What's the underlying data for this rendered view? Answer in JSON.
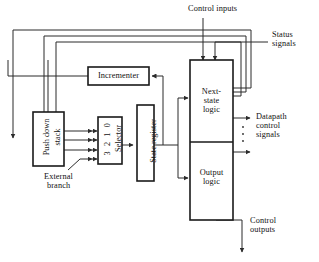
{
  "diagram": {
    "type": "block-diagram",
    "canvas": {
      "width": 319,
      "height": 262
    },
    "colors": {
      "background": "#ffffff",
      "line": "#2b2b2b",
      "box_border": "#1a1a1a",
      "text": "#111111"
    },
    "blocks": [
      {
        "id": "push-down-stack",
        "label": "Push down\nstack",
        "label_line1": "Push down",
        "label_line2": "stack",
        "orientation": "vertical-text",
        "x": 33,
        "y": 112,
        "w": 31,
        "h": 54
      },
      {
        "id": "incrementer",
        "label": "Incrementer",
        "orientation": "horizontal-text",
        "x": 88,
        "y": 67,
        "w": 61,
        "h": 18
      },
      {
        "id": "selector",
        "label": "Selector",
        "port_labels": "3 2 1 0",
        "orientation": "vertical-text",
        "x": 98,
        "y": 117,
        "w": 24,
        "h": 47
      },
      {
        "id": "state-register",
        "label": "State register",
        "orientation": "vertical-text",
        "x": 137,
        "y": 105,
        "w": 17,
        "h": 76
      },
      {
        "id": "next-state-logic",
        "label": "Next-\nstate\nlogic",
        "label_line1": "Next-",
        "label_line2": "state",
        "label_line3": "logic",
        "orientation": "horizontal-text",
        "x": 190,
        "y": 60,
        "w": 43,
        "h": 82
      },
      {
        "id": "output-logic",
        "label": "Output\nlogic",
        "label_line1": "Output",
        "label_line2": "logic",
        "orientation": "horizontal-text",
        "x": 190,
        "y": 142,
        "w": 43,
        "h": 78
      }
    ],
    "annotations": [
      {
        "id": "control-inputs",
        "text": "Control inputs",
        "x": 188,
        "y": 8
      },
      {
        "id": "status-signals",
        "line1": "Status",
        "line2": "signals",
        "x": 272,
        "y": 33
      },
      {
        "id": "datapath-control-signals",
        "line1": "Datapath",
        "line2": "control",
        "line3": "signals",
        "x": 256,
        "y": 118
      },
      {
        "id": "control-outputs",
        "line1": "Control",
        "line2": "outputs",
        "x": 262,
        "y": 222
      },
      {
        "id": "external-branch",
        "line1": "External",
        "line2": "branch",
        "x": 57,
        "y": 175
      }
    ],
    "signal_names": [
      "Control inputs",
      "Status signals",
      "Datapath control signals",
      "Control outputs",
      "External branch"
    ]
  }
}
